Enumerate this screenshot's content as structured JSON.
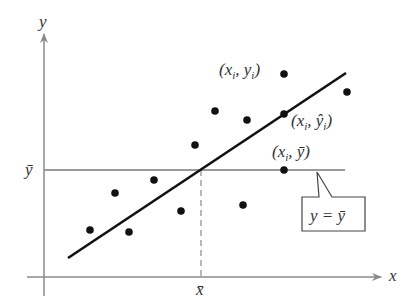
{
  "diagram": {
    "axes": {
      "x_label": "x",
      "y_label": "y",
      "x_mean_label": "x̄",
      "y_mean_label": "ȳ"
    },
    "labels": {
      "observed_point": "(xi, yi)",
      "predicted_point": "(xi, ŷi)",
      "mean_point": "(xi, ȳ)",
      "callout": "y = ȳ"
    },
    "colors": {
      "axis": "#8a8a8a",
      "regression_line": "#111111",
      "points": "#111111",
      "mean_line": "#9a9a9a"
    },
    "points": [
      {
        "x": 90,
        "y": 230
      },
      {
        "x": 115,
        "y": 193
      },
      {
        "x": 129,
        "y": 232
      },
      {
        "x": 154,
        "y": 180
      },
      {
        "x": 181,
        "y": 211
      },
      {
        "x": 195,
        "y": 145
      },
      {
        "x": 215,
        "y": 111
      },
      {
        "x": 243,
        "y": 205
      },
      {
        "x": 247,
        "y": 120
      },
      {
        "x": 284,
        "y": 74
      },
      {
        "x": 284,
        "y": 114
      },
      {
        "x": 284,
        "y": 170
      },
      {
        "x": 347,
        "y": 92
      }
    ],
    "regression_line": {
      "x1": 68,
      "y1": 258,
      "x2": 346,
      "y2": 73
    },
    "mean_intersection": {
      "x": 201,
      "y": 170
    }
  }
}
